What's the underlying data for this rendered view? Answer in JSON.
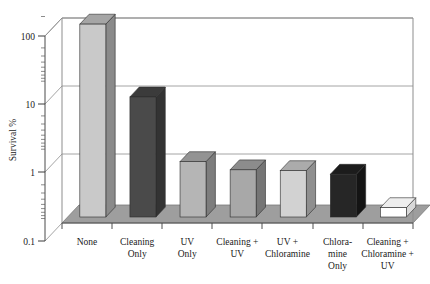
{
  "chart_data": {
    "type": "bar",
    "title": "",
    "subtitle": "",
    "xlabel": "",
    "ylabel": "Survival %",
    "yscale": "log",
    "ylim": [
      0.1,
      200
    ],
    "ytick_labels": [
      "100",
      "10",
      "1",
      "0.1"
    ],
    "ytick_values": [
      100,
      10,
      1,
      0.1
    ],
    "grid": true,
    "grid_axis": "y",
    "legend": "none",
    "style": "3d-perspective-bars",
    "categories": [
      "None",
      "Cleaning Only",
      "UV Only",
      "Cleaning + UV",
      "UV + Chloramine",
      "Chlora- mine Only",
      "Cleaning + Chloramine + UV"
    ],
    "category_lines": [
      [
        "None"
      ],
      [
        "Cleaning",
        "Only"
      ],
      [
        "UV",
        "Only"
      ],
      [
        "Cleaning +",
        "UV"
      ],
      [
        "UV +",
        "Chloramine"
      ],
      [
        "Chlora-",
        "mine",
        "Only"
      ],
      [
        "Cleaning +",
        "Chloramine +",
        "UV"
      ]
    ],
    "values": [
      100,
      8.5,
      0.95,
      0.72,
      0.7,
      0.62,
      0.2
    ],
    "bar_colors": [
      "#c9c9c9",
      "#4a4a4a",
      "#b5b5b5",
      "#a8a8a8",
      "#d2d2d2",
      "#262626",
      "#ffffff"
    ],
    "bar_side_colors": [
      "#8a8a8a",
      "#333333",
      "#7d7d7d",
      "#757575",
      "#8f8f8f",
      "#141414",
      "#d8d8d8"
    ],
    "bar_top_colors": [
      "#a5a5a5",
      "#3b3b3b",
      "#939393",
      "#8c8c8c",
      "#ababab",
      "#1c1c1c",
      "#eeeeee"
    ]
  },
  "axis": {
    "y_title": "Survival %",
    "y_labels": [
      "100",
      "10",
      "1",
      "0.1"
    ]
  },
  "colors": {
    "frame": "#8d8d8d",
    "grid": "#9a9a9a",
    "floor": "#9e9e9e",
    "floor_edge": "#7a7a7a",
    "background": "#ffffff",
    "text": "#1a1a1a"
  }
}
